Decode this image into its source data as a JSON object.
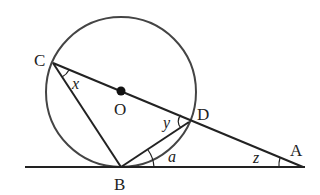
{
  "diagram": {
    "points": {
      "C": {
        "label": "C",
        "x": 53,
        "y": 63
      },
      "O": {
        "label": "O",
        "x": 121,
        "y": 91
      },
      "D": {
        "label": "D",
        "x": 189,
        "y": 122
      },
      "B": {
        "label": "B",
        "x": 121,
        "y": 167
      },
      "A": {
        "label": "A",
        "x": 303,
        "y": 167
      }
    },
    "angles": {
      "x": "x",
      "y": "y",
      "a": "a",
      "z": "z"
    },
    "circle": {
      "cx": 121,
      "cy": 92,
      "r": 75
    },
    "colors": {
      "line": "#222222",
      "circle": "#444444"
    }
  }
}
